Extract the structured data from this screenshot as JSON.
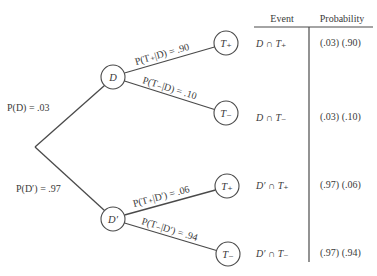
{
  "diagram": {
    "type": "probability-tree",
    "root": {
      "x": 35,
      "y": 147
    },
    "nodes": [
      {
        "id": "D",
        "label": "D",
        "x": 113,
        "y": 77,
        "r": 12
      },
      {
        "id": "Dprime",
        "label": "D′",
        "x": 113,
        "y": 219,
        "r": 12
      },
      {
        "id": "T_plus_given_D",
        "label": "T",
        "sub": "+",
        "x": 226,
        "y": 43,
        "r": 12
      },
      {
        "id": "T_minus_given_D",
        "label": "T",
        "sub": "−",
        "x": 226,
        "y": 113,
        "r": 12
      },
      {
        "id": "T_plus_given_Dprime",
        "label": "T",
        "sub": "+",
        "x": 227,
        "y": 186,
        "r": 12
      },
      {
        "id": "T_minus_given_Dprime",
        "label": "T",
        "sub": "−",
        "x": 228,
        "y": 254,
        "r": 12
      }
    ],
    "edges": [
      {
        "from": "root",
        "to": "D",
        "label": "P(D) = .03"
      },
      {
        "from": "root",
        "to": "Dprime",
        "label": "P(D′) = .97"
      },
      {
        "from": "D",
        "to": "T_plus_given_D",
        "label": "P(T₊|D) = .90"
      },
      {
        "from": "D",
        "to": "T_minus_given_D",
        "label": "P(T₋|D) = .10"
      },
      {
        "from": "Dprime",
        "to": "T_plus_given_Dprime",
        "label": "P(T₊|D′) = .06"
      },
      {
        "from": "Dprime",
        "to": "T_minus_given_Dprime",
        "label": "P(T₋|D′) = .94"
      }
    ],
    "labels": {
      "p_D": "P(D) = .03",
      "p_Dprime": "P(D′) = .97",
      "p_Tplus_D": "P(T₊|D) = .90",
      "p_Tminus_D": "P(T₋|D) = .10",
      "p_Tplus_Dprime": "P(T₊|D′) = .06",
      "p_Tminus_Dprime": "P(T₋|D′) = .94"
    },
    "node_labels": {
      "D": "D",
      "Dprime": "D′",
      "T_plus": "T₊",
      "T_minus": "T₋"
    }
  },
  "table": {
    "headers": {
      "event": "Event",
      "probability": "Probability"
    },
    "rows": [
      {
        "event": "D ∩ T₊",
        "probability": "(.03) (.90)"
      },
      {
        "event": "D ∩ T₋",
        "probability": "(.03) (.10)"
      },
      {
        "event": "D′ ∩ T₊",
        "probability": "(.97) (.06)"
      },
      {
        "event": "D′ ∩ T₋",
        "probability": "(.97) (.94)"
      }
    ]
  }
}
